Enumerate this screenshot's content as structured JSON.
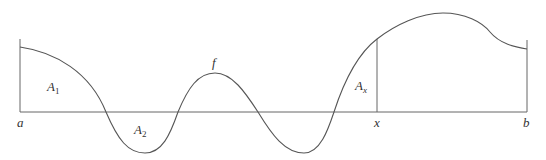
{
  "diagram": {
    "colors": {
      "curve": "#555555",
      "axis": "#666666",
      "text": "#333333",
      "background": "#ffffff"
    },
    "labels": {
      "a": "a",
      "b": "b",
      "x": "x",
      "f": "f",
      "A1": {
        "base": "A",
        "sub": "1"
      },
      "A2": {
        "base": "A",
        "sub": "2"
      },
      "Ax": {
        "base": "A",
        "sub": "x"
      }
    }
  }
}
